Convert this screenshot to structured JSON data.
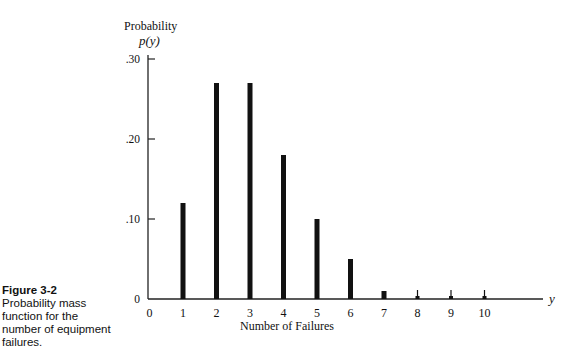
{
  "figure": {
    "caption_label": "Figure 3-2",
    "caption_text": " Probability mass function for the number of equipment failures."
  },
  "chart_data": {
    "type": "bar",
    "title": "",
    "xlabel": "Number of Failures",
    "ylabel": "Probability",
    "ylabel_symbol": "p(y)",
    "x_axis_symbol": "y",
    "categories": [
      "0",
      "1",
      "2",
      "3",
      "4",
      "5",
      "6",
      "7",
      "8",
      "9",
      "10"
    ],
    "values": [
      0.0,
      0.12,
      0.27,
      0.27,
      0.18,
      0.1,
      0.05,
      0.01,
      0.002,
      0.002,
      0.002
    ],
    "y_ticks": [
      {
        "value": 0,
        "label": "0"
      },
      {
        "value": 0.1,
        "label": ".10"
      },
      {
        "value": 0.2,
        "label": ".20"
      },
      {
        "value": 0.3,
        "label": ".30"
      }
    ],
    "ylim": [
      0,
      0.3
    ],
    "grid": false,
    "legend": null,
    "bar_color": "#111111"
  }
}
